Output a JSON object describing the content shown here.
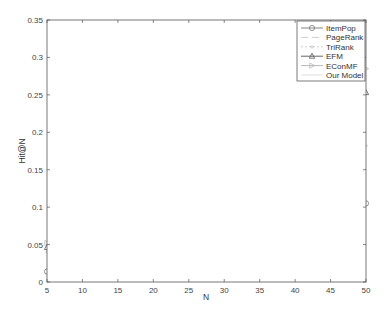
{
  "chart_data": {
    "type": "line",
    "title": "",
    "xlabel": "N",
    "ylabel": "Hit@N",
    "xlim": [
      5,
      50
    ],
    "ylim": [
      0,
      0.35
    ],
    "xticks": [
      5,
      10,
      15,
      20,
      25,
      30,
      35,
      40,
      45,
      50
    ],
    "yticks": [
      0,
      0.05,
      0.1,
      0.15,
      0.2,
      0.25,
      0.3,
      0.35
    ],
    "xtick_labels": [
      "5",
      "10",
      "15",
      "20",
      "25",
      "30",
      "35",
      "40",
      "45",
      "50"
    ],
    "ytick_labels": [
      "0",
      "0.05",
      "0.1",
      "0.15",
      "0.2",
      "0.25",
      "0.3",
      "0.35"
    ],
    "grid": false,
    "legend_position": "upper right",
    "x": [
      5,
      6,
      7,
      8,
      9,
      10,
      11,
      12,
      13,
      14,
      15,
      16,
      17,
      18,
      19,
      20,
      21,
      22,
      23,
      24,
      25,
      26,
      27,
      28,
      29,
      30,
      31,
      32,
      33,
      34,
      35,
      36,
      37,
      38,
      39,
      40,
      41,
      42,
      43,
      44,
      45,
      46,
      47,
      48,
      49,
      50
    ],
    "series": [
      {
        "name": "ItemPop",
        "marker": "circle",
        "line": "solid",
        "color": "#777777",
        "start": 0.014,
        "end": 0.105,
        "curve": 0.85
      },
      {
        "name": "PageRank",
        "marker": "none",
        "line": "dashed",
        "color": "#c8c8c8",
        "start": 0.032,
        "end": 0.16,
        "curve": 0.95
      },
      {
        "name": "TriRank",
        "marker": "plus",
        "line": "dotted",
        "color": "#c8c8c8",
        "start": 0.04,
        "end": 0.182,
        "curve": 0.95
      },
      {
        "name": "EFM",
        "marker": "triangle-up",
        "line": "solid",
        "color": "#555555",
        "start": 0.046,
        "end": 0.253,
        "curve": 1.0
      },
      {
        "name": "EConMF",
        "marker": "triangle-right",
        "line": "solid",
        "color": "#b0b0b0",
        "start": 0.052,
        "end": 0.285,
        "curve": 1.0
      },
      {
        "name": "Our Model",
        "marker": "none",
        "line": "solid",
        "color": "#dddddd",
        "start": 0.072,
        "end": 0.318,
        "curve": 1.0
      }
    ]
  },
  "legend": {
    "items": [
      "ItemPop",
      "PageRank",
      "TriRank",
      "EFM",
      "EConMF",
      "Our Model"
    ]
  },
  "axes": {
    "xlabel": "N",
    "ylabel": "Hit@N"
  }
}
